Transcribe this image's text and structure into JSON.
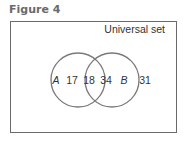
{
  "figure": {
    "title": "Figure 4",
    "universal_label": "Universal set",
    "sets": [
      {
        "name": "A",
        "only_count": "17"
      },
      {
        "name": "B",
        "only_count": "34"
      }
    ],
    "intersection_count": "18",
    "outside_count": "31"
  },
  "colors": {
    "frame": "#6a6a6a",
    "circle": "#7a7a7a",
    "text": "#333333",
    "title": "#6a6a6a"
  }
}
